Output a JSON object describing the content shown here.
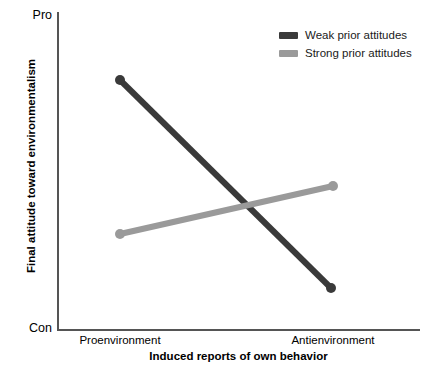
{
  "chart_data": {
    "type": "line",
    "title": "",
    "xlabel": "Induced reports of own behavior",
    "ylabel": "Final attitude toward environmentalism",
    "categories": [
      "Proenvironment",
      "Antienvironment"
    ],
    "x": [
      0,
      1
    ],
    "xlim": [
      0,
      1
    ],
    "ylim": [
      0,
      1
    ],
    "y_axis_ticklabels": [
      "Con",
      "Pro"
    ],
    "y_axis_low_label": "Con",
    "y_axis_high_label": "Pro",
    "grid": false,
    "legend_position": "top-right",
    "series": [
      {
        "name": "Weak prior attitudes",
        "color": "#3a3a3a",
        "values": [
          0.79,
          0.13
        ],
        "markers": true,
        "points": [
          {
            "x": 120,
            "y": 80
          },
          {
            "x": 331,
            "y": 288
          }
        ]
      },
      {
        "name": "Strong prior attitudes",
        "color": "#9a9a9a",
        "values": [
          0.3,
          0.45
        ],
        "markers": true,
        "points": [
          {
            "x": 120,
            "y": 234
          },
          {
            "x": 333,
            "y": 186
          }
        ]
      }
    ]
  },
  "axes": {
    "y_top_label": "Pro",
    "y_bottom_label": "Con",
    "y_title": "Final attitude toward environmentalism",
    "x_title": "Induced reports of own behavior",
    "x_tick_left": "Proenvironment",
    "x_tick_right": "Antienvironment"
  },
  "legend": {
    "entries": [
      {
        "label": "Weak prior attitudes",
        "color": "#3a3a3a"
      },
      {
        "label": "Strong prior attitudes",
        "color": "#9a9a9a"
      }
    ]
  },
  "colors": {
    "weak_series": "#3a3a3a",
    "strong_series": "#9a9a9a",
    "axis": "#555555",
    "background": "#ffffff",
    "text": "#000000"
  }
}
